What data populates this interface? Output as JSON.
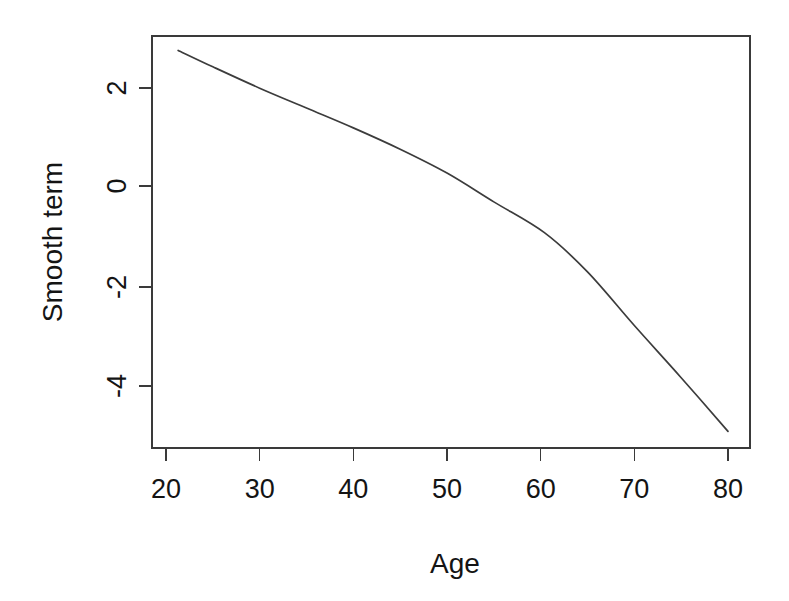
{
  "chart_data": {
    "type": "line",
    "title": "",
    "subtitle": "",
    "xlabel": "Age",
    "ylabel": "Smooth term",
    "xlim": [
      20.6,
      80.6
    ],
    "ylim": [
      -5.3,
      3.05
    ],
    "xticks": [
      20,
      30,
      40,
      50,
      60,
      70,
      80
    ],
    "xticklabels": [
      "20",
      "30",
      "40",
      "50",
      "60",
      "70",
      "80"
    ],
    "yticks": [
      2,
      0,
      -2,
      -4
    ],
    "yticklabels": [
      "2",
      "0",
      "-2",
      "-4"
    ],
    "grid": false,
    "legend": null,
    "legend_position": "none",
    "annotations": [],
    "line_color": "#3c3c3c",
    "background_color": "#ffffff",
    "box_frame": true,
    "series": [
      {
        "name": "Smooth term",
        "x": [
          21.3,
          25.0,
          30.0,
          35.0,
          40.0,
          45.0,
          50.0,
          55.0,
          60.4,
          65.0,
          70.0,
          75.0,
          80.0
        ],
        "values": [
          2.73,
          2.4,
          1.97,
          1.57,
          1.17,
          0.74,
          0.26,
          -0.32,
          -0.94,
          -1.73,
          -2.81,
          -3.86,
          -4.94
        ]
      }
    ]
  },
  "axis_titles": {
    "x": "Age",
    "y": "Smooth term"
  },
  "geometry": {
    "plot_left": 152,
    "plot_right": 750,
    "plot_top": 36,
    "plot_bottom": 448,
    "x_px_at_20": 166,
    "x_px_at_80": 728,
    "y_px_at_2": 88,
    "y_px_at_0": 186,
    "y_px_at_neg2": 287,
    "y_px_at_neg4": 386
  }
}
